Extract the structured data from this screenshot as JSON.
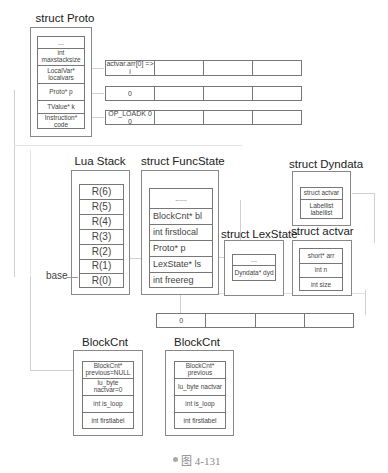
{
  "proto": {
    "title": "struct Proto",
    "fields": [
      "...",
      "int maxstacksize",
      "LocalVar* localvars",
      "Proto* p",
      "TValue* k",
      "Instruction* code"
    ]
  },
  "arrays": {
    "localvars": [
      "actvar.arr[0] => i",
      "",
      "",
      ""
    ],
    "k": [
      "0",
      "",
      "",
      ""
    ],
    "code": [
      "OP_LOADK 0 0",
      "",
      "",
      ""
    ],
    "actvar_arr": [
      "0",
      "",
      "",
      ""
    ]
  },
  "lua_stack": {
    "title": "Lua Stack",
    "slots": [
      "R(6)",
      "R(5)",
      "R(4)",
      "R(3)",
      "R(2)",
      "R(1)",
      "R(0)"
    ],
    "base_label": "base"
  },
  "funcstate": {
    "title": "struct FuncState",
    "fields": [
      "......",
      "BlockCnt* bl",
      "int firstlocal",
      "Proto* p",
      "LexState* ls",
      "int freereg"
    ]
  },
  "dyndata": {
    "title": "struct Dyndata",
    "fields": [
      "struct actvar",
      "Labellist labellist"
    ]
  },
  "lexstate": {
    "title": "struct LexState",
    "fields": [
      "...",
      "Dyndata* dyd"
    ]
  },
  "actvar": {
    "title": "struct actvar",
    "fields": [
      "short* arr",
      "int n",
      "int size"
    ]
  },
  "blockcnt1": {
    "title": "BlockCnt",
    "fields": [
      "BlockCnt* previous=NULL",
      "lu_byte nactvar=0",
      "int is_loop",
      "int firstlabel"
    ]
  },
  "blockcnt2": {
    "title": "BlockCnt",
    "fields": [
      "BlockCnt* previous",
      "lu_byte nactvar",
      "int is_loop",
      "int firstlabel"
    ]
  },
  "caption": "图 4-131",
  "colors": {
    "border": "#777777",
    "connector": "#cfcfcf",
    "text": "#333333"
  }
}
